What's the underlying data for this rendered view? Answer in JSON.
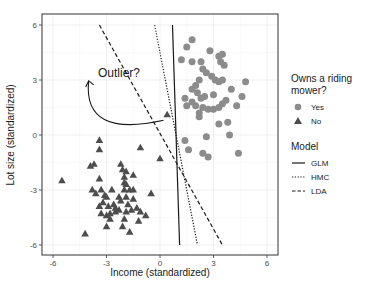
{
  "chart_data": {
    "type": "scatter",
    "title": "",
    "xlabel": "Income (standardized)",
    "ylabel": "Lot size (standardized)",
    "xlim": [
      -6.6,
      6.6
    ],
    "ylim": [
      -6.6,
      6.6
    ],
    "x_ticks": [
      -6,
      -3,
      0,
      3,
      6
    ],
    "y_ticks": [
      -6,
      -3,
      0,
      3,
      6
    ],
    "x_tick_labels": [
      "-6",
      "-3",
      "0",
      "3",
      "6"
    ],
    "y_tick_labels": [
      "-6",
      "-3",
      "0",
      "3",
      "6"
    ],
    "grid": true,
    "legend_position": "right",
    "series": [
      {
        "name": "Yes",
        "shape": "circle",
        "color": "#8c8c8c",
        "points": [
          [
            1.5,
            4.8
          ],
          [
            1.8,
            5.2
          ],
          [
            1.2,
            4.1
          ],
          [
            2.8,
            4.6
          ],
          [
            3.3,
            4.3
          ],
          [
            3.5,
            4.4
          ],
          [
            3.4,
            4.0
          ],
          [
            3.6,
            3.8
          ],
          [
            1.8,
            4.0
          ],
          [
            2.3,
            4.0
          ],
          [
            2.4,
            3.6
          ],
          [
            2.6,
            3.4
          ],
          [
            2.9,
            3.2
          ],
          [
            3.1,
            3.0
          ],
          [
            3.3,
            2.9
          ],
          [
            3.5,
            3.0
          ],
          [
            2.2,
            3.0
          ],
          [
            1.8,
            2.5
          ],
          [
            2.1,
            2.3
          ],
          [
            2.3,
            2.0
          ],
          [
            2.5,
            2.1
          ],
          [
            1.4,
            2.0
          ],
          [
            1.5,
            1.6
          ],
          [
            2.0,
            1.6
          ],
          [
            2.4,
            1.5
          ],
          [
            2.7,
            1.4
          ],
          [
            3.0,
            1.4
          ],
          [
            3.3,
            1.5
          ],
          [
            3.5,
            1.7
          ],
          [
            3.7,
            1.9
          ],
          [
            4.0,
            2.5
          ],
          [
            4.6,
            2.1
          ],
          [
            4.8,
            2.9
          ],
          [
            4.3,
            1.6
          ],
          [
            2.2,
            1.0
          ],
          [
            3.3,
            0.6
          ],
          [
            3.8,
            0.7
          ],
          [
            1.4,
            -0.3
          ],
          [
            2.6,
            -0.1
          ],
          [
            3.9,
            0.0
          ],
          [
            1.6,
            -0.8
          ],
          [
            2.4,
            -1.0
          ],
          [
            2.7,
            -1.2
          ],
          [
            4.4,
            -1.0
          ],
          [
            1.8,
            1.8
          ],
          [
            2.2,
            1.2
          ],
          [
            3.0,
            2.2
          ],
          [
            2.0,
            2.7
          ]
        ]
      },
      {
        "name": "No",
        "shape": "triangle",
        "color": "#4d4d4d",
        "points": [
          [
            0.4,
            1.1
          ],
          [
            -3.4,
            -0.3
          ],
          [
            -3.4,
            -0.8
          ],
          [
            -1.1,
            -0.7
          ],
          [
            0.0,
            -1.3
          ],
          [
            -2.2,
            -1.6
          ],
          [
            -3.7,
            -1.6
          ],
          [
            -3.9,
            -1.7
          ],
          [
            -2.1,
            -1.9
          ],
          [
            -1.9,
            -2.0
          ],
          [
            -1.5,
            -2.2
          ],
          [
            -2.0,
            -2.3
          ],
          [
            -2.0,
            -2.6
          ],
          [
            -1.9,
            -2.7
          ],
          [
            -3.4,
            -2.4
          ],
          [
            -5.5,
            -2.5
          ],
          [
            -0.5,
            -3.2
          ],
          [
            -2.7,
            -3.0
          ],
          [
            -3.3,
            -3.0
          ],
          [
            -3.6,
            -3.2
          ],
          [
            -3.8,
            -3.0
          ],
          [
            -2.0,
            -3.0
          ],
          [
            -1.7,
            -3.0
          ],
          [
            -1.5,
            -3.0
          ],
          [
            -3.0,
            -3.4
          ],
          [
            -2.3,
            -3.4
          ],
          [
            -1.9,
            -3.4
          ],
          [
            -1.5,
            -3.5
          ],
          [
            -3.2,
            -3.7
          ],
          [
            -3.4,
            -3.9
          ],
          [
            -2.9,
            -3.9
          ],
          [
            -2.6,
            -3.8
          ],
          [
            -1.8,
            -3.8
          ],
          [
            -1.3,
            -4.0
          ],
          [
            -3.3,
            -4.3
          ],
          [
            -3.0,
            -4.4
          ],
          [
            -2.8,
            -4.3
          ],
          [
            -2.5,
            -4.2
          ],
          [
            -2.3,
            -4.1
          ],
          [
            -1.9,
            -4.2
          ],
          [
            -1.6,
            -4.1
          ],
          [
            -1.1,
            -4.2
          ],
          [
            -0.8,
            -4.4
          ],
          [
            -2.0,
            -4.6
          ],
          [
            -2.8,
            -4.6
          ],
          [
            -2.1,
            -5.0
          ],
          [
            -1.7,
            -5.3
          ],
          [
            -3.0,
            -5.0
          ],
          [
            -4.2,
            -5.4
          ],
          [
            -2.5,
            -4.0
          ],
          [
            -2.2,
            -3.6
          ],
          [
            -3.1,
            -3.3
          ],
          [
            -1.2,
            -4.7
          ]
        ]
      }
    ],
    "lines": [
      {
        "name": "GLM",
        "style": "solid",
        "from": [
          0.7,
          6.0
        ],
        "to": [
          1.1,
          -6.0
        ]
      },
      {
        "name": "HMC",
        "style": "dotted",
        "from": [
          -0.3,
          6.0
        ],
        "to": [
          2.1,
          -6.0
        ]
      },
      {
        "name": "LDA",
        "style": "dashed",
        "from": [
          -3.4,
          6.0
        ],
        "to": [
          3.5,
          -6.0
        ]
      }
    ],
    "annotations": [
      {
        "text": "Outlier?",
        "x": -2.3,
        "y": 3.4,
        "arrow_to": [
          -4.0,
          2.95
        ],
        "arrow_from": [
          0.2,
          0.8
        ]
      }
    ]
  },
  "legend": {
    "group1_title_line1": "Owns a riding",
    "group1_title_line2": "mower?",
    "group1_items": [
      {
        "label": "Yes",
        "shape": "circle"
      },
      {
        "label": "No",
        "shape": "triangle"
      }
    ],
    "group2_title": "Model",
    "group2_items": [
      {
        "label": "GLM",
        "style": "solid"
      },
      {
        "label": "HMC",
        "style": "dotted"
      },
      {
        "label": "LDA",
        "style": "dashed"
      }
    ]
  }
}
